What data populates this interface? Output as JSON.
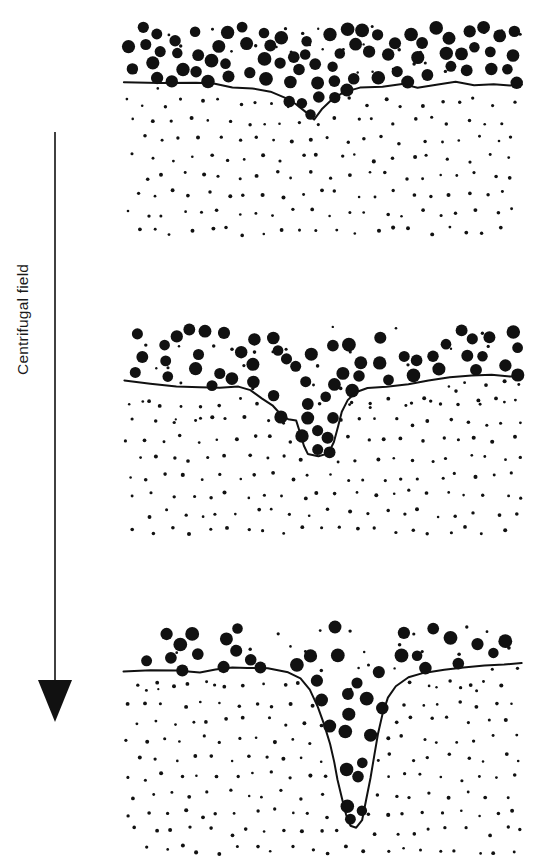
{
  "figure": {
    "axis_label": "Centrifugal field",
    "arrow_direction": "down",
    "ink_color": "#111111",
    "background_color": "#ffffff"
  },
  "chart_data": {
    "type": "diagram",
    "title": "",
    "xlabel": "",
    "ylabel": "Centrifugal field",
    "annotations": [
      "Centrifugal field"
    ],
    "legend": [],
    "grid": false,
    "panel_count": 3,
    "panel_geometry": {
      "x_left": 124,
      "x_right": 522,
      "width": 398
    },
    "particle_sizes": {
      "large_diameter_px": 12,
      "small_diameter_px": 3.2
    },
    "panels": [
      {
        "index": 1,
        "label": "",
        "top": 25,
        "bottom": 245,
        "interface_baseline_y": 82,
        "dip_center_x": 310,
        "dip_depth_px": 38,
        "dip_half_width_px": 78,
        "dip_shape": "shallow-v",
        "large_particle_band_top": 25,
        "large_particle_band_bottom": 86,
        "large_particle_count": 78,
        "small_particle_count": 300,
        "interface_path": [
          [
            124,
            82
          ],
          [
            160,
            83
          ],
          [
            196,
            83
          ],
          [
            214,
            84
          ],
          [
            232,
            88
          ],
          [
            252,
            89
          ],
          [
            270,
            92
          ],
          [
            286,
            99
          ],
          [
            296,
            104
          ],
          [
            306,
            112
          ],
          [
            314,
            120
          ],
          [
            322,
            110
          ],
          [
            332,
            100
          ],
          [
            344,
            92
          ],
          [
            360,
            88
          ],
          [
            382,
            86
          ],
          [
            402,
            84
          ],
          [
            418,
            87
          ],
          [
            438,
            85
          ],
          [
            456,
            82
          ],
          [
            474,
            85
          ],
          [
            494,
            84
          ],
          [
            510,
            86
          ],
          [
            522,
            85
          ]
        ]
      },
      {
        "index": 2,
        "label": "",
        "top": 325,
        "bottom": 545,
        "interface_baseline_y": 381,
        "dip_center_x": 318,
        "dip_depth_px": 76,
        "dip_half_width_px": 70,
        "dip_shape": "narrow-u",
        "large_particle_band_top": 325,
        "large_particle_band_bottom": 420,
        "large_particle_count": 62,
        "small_particle_count": 330,
        "interface_path": [
          [
            124,
            381
          ],
          [
            150,
            384
          ],
          [
            176,
            386
          ],
          [
            200,
            387
          ],
          [
            220,
            388
          ],
          [
            238,
            386
          ],
          [
            250,
            390
          ],
          [
            262,
            398
          ],
          [
            272,
            406
          ],
          [
            280,
            414
          ],
          [
            288,
            420
          ],
          [
            296,
            421
          ],
          [
            300,
            432
          ],
          [
            304,
            446
          ],
          [
            308,
            454
          ],
          [
            318,
            457
          ],
          [
            328,
            454
          ],
          [
            334,
            442
          ],
          [
            338,
            426
          ],
          [
            342,
            412
          ],
          [
            348,
            400
          ],
          [
            356,
            392
          ],
          [
            368,
            388
          ],
          [
            386,
            386
          ],
          [
            408,
            384
          ],
          [
            428,
            380
          ],
          [
            450,
            377
          ],
          [
            472,
            376
          ],
          [
            492,
            375
          ],
          [
            510,
            376
          ],
          [
            522,
            376
          ]
        ]
      },
      {
        "index": 3,
        "label": "",
        "top": 625,
        "bottom": 862,
        "interface_baseline_y": 672,
        "dip_center_x": 350,
        "dip_depth_px": 156,
        "dip_half_width_px": 68,
        "dip_shape": "deep-narrow-funnel",
        "large_particle_band_top": 625,
        "large_particle_band_bottom": 700,
        "large_particle_count": 44,
        "small_particle_count": 360,
        "interface_path": [
          [
            124,
            672
          ],
          [
            150,
            670
          ],
          [
            176,
            671
          ],
          [
            200,
            673
          ],
          [
            216,
            670
          ],
          [
            232,
            667
          ],
          [
            248,
            668
          ],
          [
            268,
            669
          ],
          [
            288,
            672
          ],
          [
            300,
            678
          ],
          [
            310,
            690
          ],
          [
            318,
            706
          ],
          [
            324,
            724
          ],
          [
            330,
            744
          ],
          [
            334,
            762
          ],
          [
            338,
            780
          ],
          [
            342,
            798
          ],
          [
            346,
            814
          ],
          [
            350,
            826
          ],
          [
            356,
            828
          ],
          [
            362,
            820
          ],
          [
            366,
            800
          ],
          [
            370,
            778
          ],
          [
            374,
            756
          ],
          [
            378,
            734
          ],
          [
            382,
            714
          ],
          [
            388,
            698
          ],
          [
            396,
            686
          ],
          [
            408,
            678
          ],
          [
            424,
            673
          ],
          [
            444,
            670
          ],
          [
            464,
            668
          ],
          [
            484,
            665
          ],
          [
            504,
            664
          ],
          [
            522,
            663
          ]
        ]
      }
    ]
  }
}
